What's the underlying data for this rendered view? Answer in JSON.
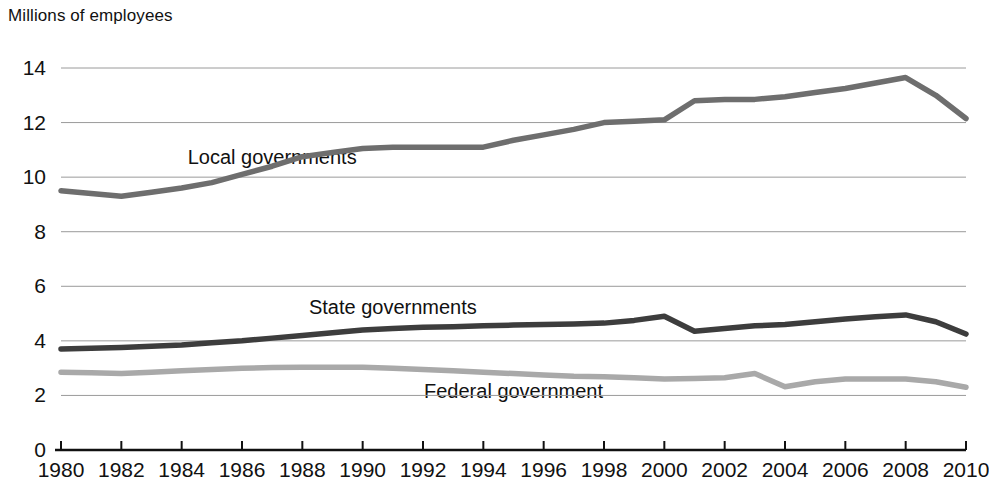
{
  "chart_data": {
    "type": "line",
    "title": "",
    "ylabel": "Millions of employees",
    "xlabel": "",
    "ylim": [
      0,
      14
    ],
    "xlim": [
      1980,
      2010
    ],
    "grid": true,
    "legend_position": "inline-labels",
    "yticks": [
      0,
      2,
      4,
      6,
      8,
      10,
      12,
      14
    ],
    "ytick_labels": [
      "0",
      "2",
      "4",
      "6",
      "8",
      "10",
      "12",
      "14"
    ],
    "xticks": [
      1980,
      1982,
      1984,
      1986,
      1988,
      1990,
      1992,
      1994,
      1996,
      1998,
      2000,
      2002,
      2004,
      2006,
      2008,
      2010
    ],
    "xtick_labels": [
      "1980",
      "1982",
      "1984",
      "1986",
      "1988",
      "1990",
      "1992",
      "1994",
      "1996",
      "1998",
      "2000",
      "2002",
      "2004",
      "2006",
      "2008",
      "2010"
    ],
    "x": [
      1980,
      1981,
      1982,
      1983,
      1984,
      1985,
      1986,
      1987,
      1988,
      1989,
      1990,
      1991,
      1992,
      1993,
      1994,
      1995,
      1996,
      1997,
      1998,
      1999,
      2000,
      2001,
      2002,
      2003,
      2004,
      2005,
      2006,
      2007,
      2008,
      2009,
      2010
    ],
    "series": [
      {
        "name": "Local governments",
        "color": "#6e6e6e",
        "label_x": 1987,
        "label_y": 10.75,
        "values": [
          9.5,
          9.4,
          9.3,
          9.45,
          9.6,
          9.8,
          10.1,
          10.4,
          10.75,
          10.9,
          11.05,
          11.1,
          11.1,
          11.1,
          11.1,
          11.35,
          11.55,
          11.75,
          12.0,
          12.05,
          12.1,
          12.8,
          12.85,
          12.85,
          12.95,
          13.1,
          13.25,
          13.45,
          13.65,
          13.0,
          12.15
        ]
      },
      {
        "name": "State governments",
        "color": "#3d3d3d",
        "label_x": 1991,
        "label_y": 5.25,
        "values": [
          3.7,
          3.73,
          3.76,
          3.8,
          3.85,
          3.93,
          4.0,
          4.1,
          4.2,
          4.3,
          4.4,
          4.45,
          4.5,
          4.52,
          4.55,
          4.58,
          4.6,
          4.62,
          4.65,
          4.75,
          4.9,
          4.35,
          4.45,
          4.55,
          4.6,
          4.7,
          4.8,
          4.88,
          4.95,
          4.7,
          4.25
        ]
      },
      {
        "name": "Federal government",
        "color": "#a9a9a9",
        "label_x": 1995,
        "label_y": 2.15,
        "values": [
          2.85,
          2.83,
          2.8,
          2.85,
          2.9,
          2.95,
          3.0,
          3.02,
          3.03,
          3.03,
          3.03,
          3.0,
          2.95,
          2.9,
          2.85,
          2.8,
          2.75,
          2.7,
          2.68,
          2.65,
          2.6,
          2.62,
          2.65,
          2.8,
          2.32,
          2.5,
          2.6,
          2.6,
          2.6,
          2.5,
          2.3
        ]
      }
    ]
  }
}
